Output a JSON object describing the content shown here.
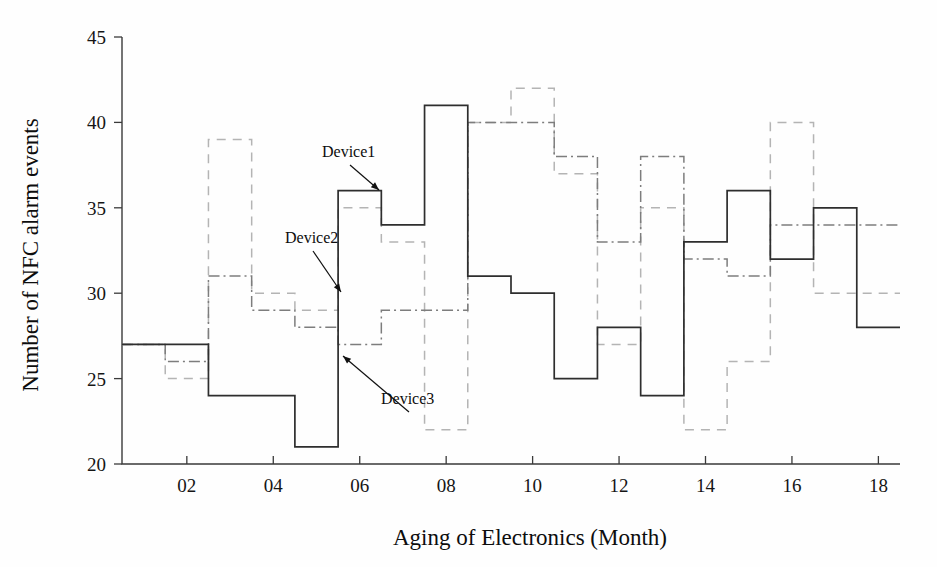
{
  "figure": {
    "background": "#fefefe",
    "ylabel": "Number of NFC alarm events",
    "xlabel": "Aging of Electronics (Month)"
  },
  "axes": {
    "y_ticks": [
      "20",
      "25",
      "30",
      "35",
      "40",
      "45"
    ],
    "x_ticks": [
      "02",
      "04",
      "06",
      "08",
      "10",
      "12",
      "14",
      "16",
      "18"
    ]
  },
  "annotations": [
    {
      "name": "device1",
      "label": "Device1",
      "text_x": 322,
      "text_y": 157,
      "ax": 379,
      "ay": 190
    },
    {
      "name": "device2",
      "label": "Device2",
      "text_x": 285,
      "text_y": 243,
      "ax": 341,
      "ay": 292
    },
    {
      "name": "device3",
      "label": "Device3",
      "text_x": 381,
      "text_y": 404,
      "ax": 343,
      "ay": 356
    }
  ],
  "chart_data": {
    "type": "line",
    "drawstyle": "steps-post",
    "title": "",
    "xlabel": "Aging of Electronics (Month)",
    "ylabel": "Number of NFC alarm events",
    "xlim": [
      0.5,
      18.5
    ],
    "ylim": [
      20,
      45
    ],
    "yticks": [
      20,
      25,
      30,
      35,
      40,
      45
    ],
    "xticks": [
      2,
      4,
      6,
      8,
      10,
      12,
      14,
      16,
      18
    ],
    "xticklabels": [
      "02",
      "04",
      "06",
      "08",
      "10",
      "12",
      "14",
      "16",
      "18"
    ],
    "grid": false,
    "legend": "inline-annotations",
    "x": [
      1,
      2,
      3,
      4,
      5,
      6,
      7,
      8,
      9,
      10,
      11,
      12,
      13,
      14,
      15,
      16,
      17,
      18
    ],
    "series": [
      {
        "name": "Device1",
        "style": "solid",
        "color": "#2e2e2e",
        "values": [
          27,
          27,
          24,
          24,
          21,
          36,
          34,
          41,
          31,
          30,
          25,
          28,
          24,
          33,
          36,
          32,
          35,
          28
        ]
      },
      {
        "name": "Device2",
        "style": "dashed",
        "color": "#b4b4b4",
        "values": [
          27,
          25,
          39,
          30,
          29,
          35,
          33,
          22,
          40,
          42,
          37,
          27,
          35,
          22,
          26,
          40,
          30,
          30
        ]
      },
      {
        "name": "Device3",
        "style": "dashdot",
        "color": "#7d7d7d",
        "values": [
          27,
          26,
          31,
          29,
          28,
          27,
          29,
          29,
          40,
          40,
          38,
          33,
          38,
          32,
          31,
          34,
          34,
          34
        ]
      }
    ]
  }
}
